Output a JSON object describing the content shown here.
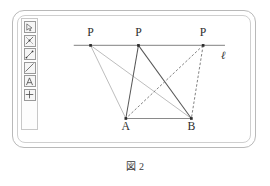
{
  "app": {
    "name": "geometry-whiteboard",
    "frame_color": "#b9b9b9"
  },
  "toolbar": {
    "name": "drawing-tools",
    "items": [
      {
        "id": "select",
        "icon": "cursor-arrow-icon",
        "label": "Select"
      },
      {
        "id": "point",
        "icon": "point-marker-icon",
        "label": "Point"
      },
      {
        "id": "segment",
        "icon": "segment-icon",
        "label": "Segment"
      },
      {
        "id": "line",
        "icon": "line-icon",
        "label": "Line"
      },
      {
        "id": "text",
        "icon": "text-a-icon",
        "label": "Text"
      },
      {
        "id": "move",
        "icon": "move-crosshair-icon",
        "label": "Move"
      }
    ]
  },
  "canvas": {
    "name": "geometry-figure",
    "line_ell": {
      "label": "ℓ",
      "y": 35,
      "x1": 18,
      "x2": 198,
      "color": "#9a9a9a",
      "width": 1.6
    },
    "points": [
      {
        "id": "P1",
        "label": "P",
        "x": 38,
        "y": 35,
        "label_x": 38,
        "label_y": 24
      },
      {
        "id": "P2",
        "label": "P",
        "x": 95,
        "y": 35,
        "label_x": 95,
        "label_y": 24
      },
      {
        "id": "P3",
        "label": "P",
        "x": 172,
        "y": 35,
        "label_x": 172,
        "label_y": 24
      },
      {
        "id": "A",
        "label": "A",
        "x": 80,
        "y": 122,
        "label_x": 80,
        "label_y": 136
      },
      {
        "id": "B",
        "label": "B",
        "x": 158,
        "y": 122,
        "label_x": 158,
        "label_y": 136
      }
    ],
    "segments": [
      {
        "id": "P1-A",
        "from": "P1",
        "to": "A",
        "style": "solid",
        "color": "#b0b0b0",
        "width": 1
      },
      {
        "id": "P1-B",
        "from": "P1",
        "to": "B",
        "style": "solid",
        "color": "#b0b0b0",
        "width": 1
      },
      {
        "id": "P2-A",
        "from": "P2",
        "to": "A",
        "style": "solid",
        "color": "#555555",
        "width": 1.2
      },
      {
        "id": "P2-B",
        "from": "P2",
        "to": "B",
        "style": "solid",
        "color": "#555555",
        "width": 1.2
      },
      {
        "id": "P3-A",
        "from": "P3",
        "to": "A",
        "style": "dashed",
        "color": "#6a6a6a",
        "width": 1
      },
      {
        "id": "P3-B",
        "from": "P3",
        "to": "B",
        "style": "dashed",
        "color": "#6a6a6a",
        "width": 1
      },
      {
        "id": "A-B",
        "from": "A",
        "to": "B",
        "style": "solid",
        "color": "#8a8a8a",
        "width": 1.4
      }
    ],
    "label_color": "#2e2e2e",
    "point_color": "#2b2b2b"
  },
  "caption": {
    "prefix": "図",
    "number": "2"
  }
}
